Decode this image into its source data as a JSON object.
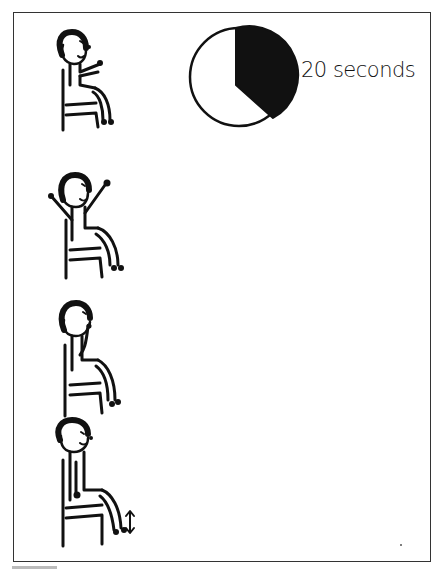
{
  "figure": {
    "type": "exercise-instruction-illustration",
    "timer": {
      "label": "20 seconds",
      "pie_filled_fraction": 0.34,
      "filled_color": "#111111",
      "empty_color": "#ffffff"
    },
    "steps": [
      {
        "index": 1,
        "pose": "seated-arms-forward",
        "name": "figure-step-1"
      },
      {
        "index": 2,
        "pose": "seated-arms-raised-overhead",
        "name": "figure-step-2"
      },
      {
        "index": 3,
        "pose": "seated-hand-to-face",
        "name": "figure-step-3"
      },
      {
        "index": 4,
        "pose": "seated-arms-down-heel-raise",
        "name": "figure-step-4",
        "annotation": "up-down-arrow"
      }
    ],
    "line_color": "#111111",
    "frame_color": "#333333"
  }
}
